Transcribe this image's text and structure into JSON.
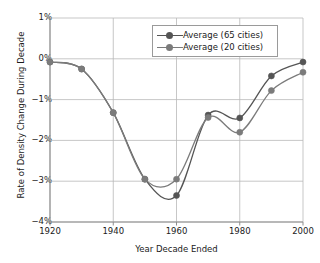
{
  "chart_data": {
    "type": "line",
    "title": "",
    "xlabel": "Year Decade Ended",
    "ylabel": "Rate of Density Change During Decade",
    "x": [
      1920,
      1930,
      1940,
      1950,
      1960,
      1970,
      1980,
      1990,
      2000
    ],
    "xticks": [
      "1920",
      "1940",
      "1960",
      "1980",
      "2000"
    ],
    "xtick_values": [
      1920,
      1940,
      1960,
      1980,
      2000
    ],
    "yticks": [
      "1%",
      "0%",
      "−1%",
      "−2%",
      "−3%",
      "−4%"
    ],
    "ytick_values": [
      1,
      0,
      -1,
      -2,
      -3,
      -4
    ],
    "xlim": [
      1920,
      2000
    ],
    "ylim": [
      -4,
      1
    ],
    "grid": "horizontal-and-vertical-major",
    "legend_position": "upper-center-right",
    "series": [
      {
        "name": "Average (65 cities)",
        "color": "#555555",
        "marker": "circle",
        "values": [
          -0.08,
          -0.25,
          -1.32,
          -2.95,
          -3.35,
          -1.38,
          -1.45,
          -0.42,
          -0.08
        ]
      },
      {
        "name": "Average (20 cities)",
        "color": "#7b7b7b",
        "marker": "circle",
        "values": [
          -0.08,
          -0.25,
          -1.32,
          -2.95,
          -2.95,
          -1.44,
          -1.8,
          -0.78,
          -0.33
        ]
      }
    ]
  },
  "legend": {
    "items": [
      {
        "label": "Average (65 cities)"
      },
      {
        "label": "Average (20 cities)"
      }
    ]
  },
  "colors": {
    "series_65": "#555555",
    "series_20": "#7b7b7b",
    "grid": "#b9b9b9",
    "axis": "#8d8d8d",
    "text": "#1a1a1a",
    "legend_border": "#9a9a9a",
    "background": "#ffffff"
  }
}
